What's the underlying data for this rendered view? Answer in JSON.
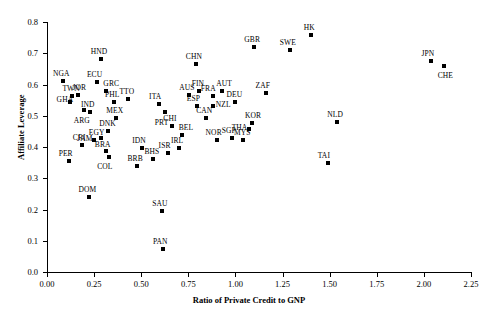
{
  "chart_data": {
    "type": "scatter",
    "title": "",
    "xlabel": "Ratio of Private Credit to GNP",
    "ylabel": "Affiliate Leverage",
    "xlim": [
      0.0,
      2.25
    ],
    "ylim": [
      0.0,
      0.8
    ],
    "xticks": [
      "0.00",
      "0.25",
      "0.50",
      "0.75",
      "1.00",
      "1.25",
      "1.50",
      "1.75",
      "2.00",
      "2.25"
    ],
    "xtick_values": [
      0.0,
      0.25,
      0.5,
      0.75,
      1.0,
      1.25,
      1.5,
      1.75,
      2.0,
      2.25
    ],
    "yticks": [
      "0.0",
      "0.1",
      "0.2",
      "0.3",
      "0.4",
      "0.5",
      "0.6",
      "0.7",
      "0.8"
    ],
    "ytick_values": [
      0.0,
      0.1,
      0.2,
      0.3,
      0.4,
      0.5,
      0.6,
      0.7,
      0.8
    ],
    "grid": false,
    "legend": false,
    "marker": "square",
    "marker_color": "#000000",
    "points": [
      {
        "label": "NGA",
        "x": 0.085,
        "y": 0.612,
        "lx": -10,
        "ly": -11
      },
      {
        "label": "HND",
        "x": 0.285,
        "y": 0.681,
        "lx": -10,
        "ly": -11
      },
      {
        "label": "ECU",
        "x": 0.265,
        "y": 0.608,
        "lx": -10,
        "ly": -11
      },
      {
        "label": "GRC",
        "x": 0.315,
        "y": 0.58,
        "lx": -3,
        "ly": -11
      },
      {
        "label": "TWN",
        "x": 0.135,
        "y": 0.563,
        "lx": -10,
        "ly": -11
      },
      {
        "label": "JOR",
        "x": 0.162,
        "y": 0.566,
        "lx": -5,
        "ly": -11
      },
      {
        "label": "GHA",
        "x": 0.12,
        "y": 0.545,
        "lx": -13,
        "ly": -6
      },
      {
        "label": "IND",
        "x": 0.228,
        "y": 0.513,
        "lx": -9,
        "ly": -11
      },
      {
        "label": "PHL",
        "x": 0.355,
        "y": 0.545,
        "lx": -9,
        "ly": -11
      },
      {
        "label": "TTO",
        "x": 0.432,
        "y": 0.555,
        "lx": -9,
        "ly": -11
      },
      {
        "label": "MEX",
        "x": 0.368,
        "y": 0.494,
        "lx": -10,
        "ly": -11
      },
      {
        "label": "ARG",
        "x": 0.195,
        "y": 0.52,
        "lx": -10,
        "ly": 7
      },
      {
        "label": "ITA",
        "x": 0.595,
        "y": 0.537,
        "lx": -10,
        "ly": -11
      },
      {
        "label": "PRT",
        "x": 0.625,
        "y": 0.512,
        "lx": -10,
        "ly": 7
      },
      {
        "label": "AUS",
        "x": 0.755,
        "y": 0.566,
        "lx": -10,
        "ly": -11
      },
      {
        "label": "FIN",
        "x": 0.805,
        "y": 0.578,
        "lx": -7,
        "ly": -11
      },
      {
        "label": "ESP",
        "x": 0.795,
        "y": 0.53,
        "lx": -10,
        "ly": -11
      },
      {
        "label": "AUT",
        "x": 0.93,
        "y": 0.578,
        "lx": -6,
        "ly": -11
      },
      {
        "label": "FRA",
        "x": 0.88,
        "y": 0.562,
        "lx": -12,
        "ly": -11
      },
      {
        "label": "DEU",
        "x": 1.0,
        "y": 0.545,
        "lx": -9,
        "ly": -11
      },
      {
        "label": "NZL",
        "x": 0.88,
        "y": 0.532,
        "lx": 3,
        "ly": -5
      },
      {
        "label": "CAN",
        "x": 0.845,
        "y": 0.494,
        "lx": -10,
        "ly": -11
      },
      {
        "label": "CHI",
        "x": 0.665,
        "y": 0.466,
        "lx": -9,
        "ly": -11
      },
      {
        "label": "BEL",
        "x": 0.715,
        "y": 0.437,
        "lx": -3,
        "ly": -11
      },
      {
        "label": "NOR",
        "x": 0.9,
        "y": 0.424,
        "lx": -11,
        "ly": -11
      },
      {
        "label": "SGP",
        "x": 0.98,
        "y": 0.428,
        "lx": -10,
        "ly": -11
      },
      {
        "label": "MYS",
        "x": 1.04,
        "y": 0.421,
        "lx": -9,
        "ly": -11
      },
      {
        "label": "ISR",
        "x": 0.64,
        "y": 0.382,
        "lx": -9,
        "ly": -11
      },
      {
        "label": "IRL",
        "x": 0.7,
        "y": 0.397,
        "lx": -8,
        "ly": -11
      },
      {
        "label": "DNK",
        "x": 0.325,
        "y": 0.452,
        "lx": -9,
        "ly": -11
      },
      {
        "label": "EGY",
        "x": 0.285,
        "y": 0.43,
        "lx": -12,
        "ly": -9
      },
      {
        "label": "JAM",
        "x": 0.25,
        "y": 0.421,
        "lx": -17,
        "ly": -5
      },
      {
        "label": "CRI",
        "x": 0.185,
        "y": 0.408,
        "lx": -9,
        "ly": -11
      },
      {
        "label": "BRA",
        "x": 0.312,
        "y": 0.388,
        "lx": -11,
        "ly": -10
      },
      {
        "label": "COL",
        "x": 0.33,
        "y": 0.368,
        "lx": -12,
        "ly": 6
      },
      {
        "label": "IDN",
        "x": 0.505,
        "y": 0.397,
        "lx": -10,
        "ly": -11
      },
      {
        "label": "BHS",
        "x": 0.565,
        "y": 0.361,
        "lx": -9,
        "ly": -11
      },
      {
        "label": "BRB",
        "x": 0.475,
        "y": 0.338,
        "lx": -9,
        "ly": -11
      },
      {
        "label": "PER",
        "x": 0.115,
        "y": 0.356,
        "lx": -10,
        "ly": -11
      },
      {
        "label": "DOM",
        "x": 0.225,
        "y": 0.241,
        "lx": -11,
        "ly": -11
      },
      {
        "label": "SAU",
        "x": 0.612,
        "y": 0.196,
        "lx": -10,
        "ly": -11
      },
      {
        "label": "PAN",
        "x": 0.615,
        "y": 0.075,
        "lx": -10,
        "ly": -11
      },
      {
        "label": "CHN",
        "x": 0.79,
        "y": 0.666,
        "lx": -10,
        "ly": -11
      },
      {
        "label": "GBR",
        "x": 1.1,
        "y": 0.72,
        "lx": -10,
        "ly": -11
      },
      {
        "label": "SWE",
        "x": 1.288,
        "y": 0.71,
        "lx": -10,
        "ly": -11
      },
      {
        "label": "HK",
        "x": 1.4,
        "y": 0.758,
        "lx": -7,
        "ly": -11
      },
      {
        "label": "ZAF",
        "x": 1.16,
        "y": 0.572,
        "lx": -10,
        "ly": -11
      },
      {
        "label": "KOR",
        "x": 1.088,
        "y": 0.478,
        "lx": -7,
        "ly": -11
      },
      {
        "label": "THA",
        "x": 1.07,
        "y": 0.458,
        "lx": -17,
        "ly": -5
      },
      {
        "label": "NLD",
        "x": 1.54,
        "y": 0.48,
        "lx": -10,
        "ly": -11
      },
      {
        "label": "TAI",
        "x": 1.49,
        "y": 0.348,
        "lx": -10,
        "ly": -11
      },
      {
        "label": "JPN",
        "x": 2.04,
        "y": 0.674,
        "lx": -10,
        "ly": -11
      },
      {
        "label": "CHE",
        "x": 2.105,
        "y": 0.66,
        "lx": -6,
        "ly": 6
      }
    ]
  }
}
